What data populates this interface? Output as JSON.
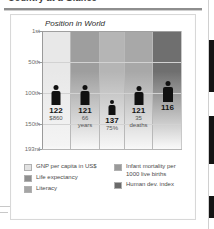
{
  "top_strip": {
    "heading": "Country at a Glance",
    "note": "partially cropped heading rule"
  },
  "chart_data": {
    "type": "bar",
    "title": "Position in World",
    "xlabel": "",
    "ylabel": "Position in World",
    "ylim_labels": [
      "1st",
      "50th",
      "100th",
      "150th",
      "193rd"
    ],
    "ylim": [
      1,
      193
    ],
    "grid": true,
    "legend_position": "bottom",
    "categories": [
      "GNP per capita in US$",
      "Life expectancy",
      "Literacy",
      "Infant mortality per 1000 live births",
      "Human dev. index"
    ],
    "values": [
      122,
      121,
      137,
      121,
      116
    ],
    "value_labels": [
      "122",
      "121",
      "137",
      "121",
      "116"
    ],
    "sub_labels": [
      "$860",
      "66 years",
      "75%",
      "35 deaths",
      ""
    ],
    "series": [
      {
        "name": "World rank",
        "values": [
          122,
          121,
          137,
          121,
          116
        ]
      }
    ]
  },
  "axis": {
    "ticks": [
      {
        "label": "1st",
        "value": 1
      },
      {
        "label": "50th",
        "value": 50
      },
      {
        "label": "100th",
        "value": 100
      },
      {
        "label": "150th",
        "value": 150
      },
      {
        "label": "193rd",
        "value": 193
      }
    ]
  },
  "bars": [
    {
      "rank": "122",
      "sub": "$860",
      "sub2": "",
      "color": "#e8e8e8"
    },
    {
      "rank": "121",
      "sub": "66",
      "sub2": "years",
      "color": "#9e9e9e"
    },
    {
      "rank": "137",
      "sub": "75%",
      "sub2": "",
      "color": "#b5b5b5"
    },
    {
      "rank": "121",
      "sub": "35",
      "sub2": "deaths",
      "color": "#a8a8a8"
    },
    {
      "rank": "116",
      "sub": "",
      "sub2": "",
      "color": "#6f6f6f"
    }
  ],
  "legend": {
    "left_column": [
      {
        "label": "GNP per capita in US$",
        "color": "#e2e2e2"
      },
      {
        "label": "Life expectancy",
        "color": "#8f8f8f"
      },
      {
        "label": "Literacy",
        "color": "#a5a5a5"
      }
    ],
    "right_column": [
      {
        "label": "Infant mortality per",
        "label2": "1000 live births",
        "color": "#9a9a9a"
      },
      {
        "label": "Human dev. index",
        "label2": "",
        "color": "#6a6a6a"
      }
    ]
  },
  "colors": {
    "figure": "#111111",
    "grid": "#d2d2d2",
    "axis": "#9a9a9a",
    "panel_border": "#d8d8d8",
    "page_edge": "#141414"
  }
}
